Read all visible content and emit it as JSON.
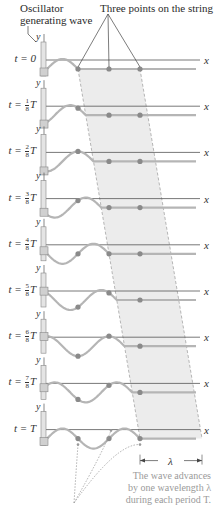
{
  "header": {
    "oscillator_label_line1": "Oscillator",
    "oscillator_label_line2": "generating wave",
    "points_label": "Three points on the string"
  },
  "axes": {
    "x_label": "x",
    "y_label": "y"
  },
  "rows": [
    {
      "prefix": "t = ",
      "num": "",
      "den": "",
      "suffix": "0",
      "phase": 0
    },
    {
      "prefix": "t = ",
      "num": "1",
      "den": "8",
      "suffix": "T",
      "phase": 1
    },
    {
      "prefix": "t = ",
      "num": "2",
      "den": "8",
      "suffix": "T",
      "phase": 2
    },
    {
      "prefix": "t = ",
      "num": "3",
      "den": "8",
      "suffix": "T",
      "phase": 3
    },
    {
      "prefix": "t = ",
      "num": "4",
      "den": "8",
      "suffix": "T",
      "phase": 4
    },
    {
      "prefix": "t = ",
      "num": "5",
      "den": "8",
      "suffix": "T",
      "phase": 5
    },
    {
      "prefix": "t = ",
      "num": "6",
      "den": "8",
      "suffix": "T",
      "phase": 6
    },
    {
      "prefix": "t = ",
      "num": "7",
      "den": "8",
      "suffix": "T",
      "phase": 7
    },
    {
      "prefix": "t = ",
      "num": "",
      "den": "",
      "suffix": "T",
      "phase": 8
    }
  ],
  "wavelength_label": "λ",
  "caption": {
    "line1": "The wave advances",
    "line2": "by one wavelength λ",
    "line3": "during each period T."
  },
  "colors": {
    "wave": "#b5b5b5",
    "axis": "#555555",
    "dot": "#8a8a8a",
    "band": "#ececec",
    "band_edge": "#9a9a9a",
    "oscillator": "#d0d0d0"
  }
}
